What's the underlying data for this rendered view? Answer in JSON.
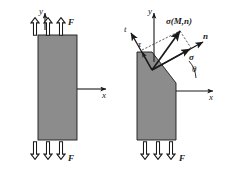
{
  "figure": {
    "background_color": "#ffffff",
    "body_fill_color": "#8c8c8c",
    "body_stroke_color": "#1a1a1a",
    "line_color": "#1a1a1a",
    "arrow_outline_fill": "#ffffff"
  },
  "left_panel": {
    "name": "undivided-bar",
    "axes": {
      "y_label": "y",
      "x_label": "x"
    },
    "load_label_top": "F",
    "load_label_bottom": "F",
    "top_arrow_count": 3,
    "bottom_arrow_count": 3,
    "bar": {
      "x": 38,
      "y": 35,
      "width": 39,
      "height": 105
    }
  },
  "right_panel": {
    "name": "sectioned-bar",
    "axes": {
      "y_label": "y",
      "x_label": "x"
    },
    "load_label_top": "F",
    "load_label_bottom": "F",
    "top_arrow_count": 0,
    "bottom_arrow_count": 3,
    "vectors": [
      {
        "name": "tangent-axis",
        "label": "t"
      },
      {
        "name": "shear-stress",
        "label": "τ"
      },
      {
        "name": "total-stress",
        "label": "σ(M,n)"
      },
      {
        "name": "normal-axis",
        "label": "n"
      },
      {
        "name": "normal-stress",
        "label": "σ"
      }
    ],
    "angle_label": "θ"
  }
}
